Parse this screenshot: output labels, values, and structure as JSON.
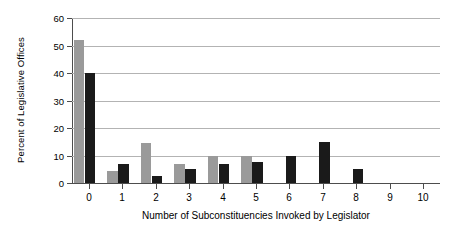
{
  "chart_data": {
    "type": "bar",
    "title": "",
    "xlabel": "Number of Subconstituencies Invoked by Legislator",
    "ylabel": "Percent of Legislative Offices",
    "categories": [
      "0",
      "1",
      "2",
      "3",
      "4",
      "5",
      "6",
      "7",
      "8",
      "9",
      "10"
    ],
    "series": [
      {
        "name": "series-a",
        "color": "#9a9a9a",
        "values": [
          52,
          4.5,
          14.5,
          7,
          10,
          10,
          0,
          0,
          0,
          0,
          0
        ]
      },
      {
        "name": "series-b",
        "color": "#1a1a1a",
        "values": [
          40,
          7,
          2.5,
          5,
          7,
          7.5,
          10,
          15,
          5,
          0,
          0
        ]
      }
    ],
    "ylim": [
      0,
      60
    ],
    "yticks": [
      0,
      10,
      20,
      30,
      40,
      50,
      60
    ],
    "ytick_labels": [
      "0",
      "10",
      "20",
      "30",
      "40",
      "50",
      "60"
    ],
    "grid": "horizontal",
    "legend": "none",
    "gridline_color": "#b3b3b3",
    "axis_color": "#4d4d4d",
    "background": "#ffffff"
  }
}
